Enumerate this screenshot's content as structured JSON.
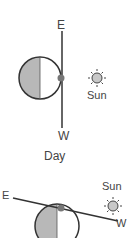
{
  "top": {
    "east": "E",
    "west": "W",
    "sun": "Sun",
    "caption": "Day"
  },
  "bottom": {
    "east": "E",
    "west": "W",
    "sun": "Sun"
  },
  "colors": {
    "line": "#333333",
    "shade": "#b5b5b5",
    "dot": "#777777",
    "sun": "#c8c8c8"
  }
}
